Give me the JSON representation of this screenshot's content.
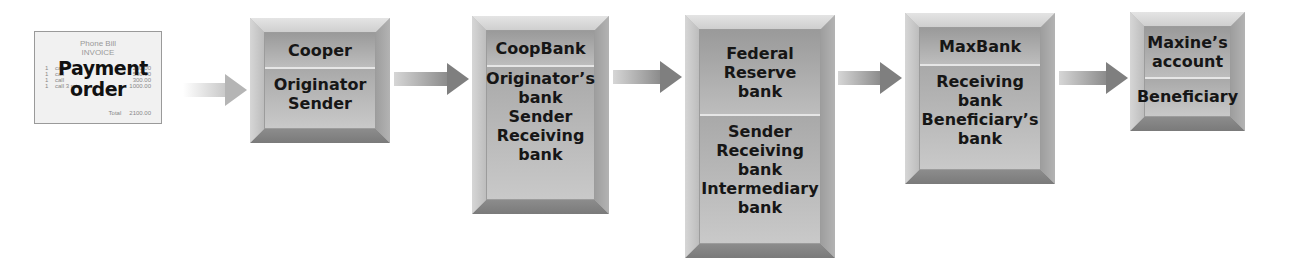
{
  "invoice": {
    "header_line1": "Phone Bill",
    "header_line2": "INVOICE",
    "title": "Payment order",
    "rows": [
      {
        "qty": "1",
        "desc": "call",
        "amount": "200.00"
      },
      {
        "qty": "1",
        "desc": "call",
        "amount": "500.00"
      },
      {
        "qty": "1",
        "desc": "call",
        "amount": "300.00"
      },
      {
        "qty": "1",
        "desc": "call 3 min",
        "amount": "1000.00"
      }
    ],
    "total_label": "Total",
    "total_value": "2100.00"
  },
  "nodes": [
    {
      "id": "cooper",
      "top": "Cooper",
      "bottom": "Originator\nSender"
    },
    {
      "id": "coopbank",
      "top": "CoopBank",
      "bottom": "Originator’s\nbank\nSender\nReceiving\nbank"
    },
    {
      "id": "federal-reserve",
      "top": "Federal\nReserve\nbank",
      "bottom": "Sender\nReceiving\nbank\nIntermediary\nbank"
    },
    {
      "id": "maxbank",
      "top": "MaxBank",
      "bottom": "Receiving\nbank\nBeneficiary’s\nbank"
    },
    {
      "id": "maxines-account",
      "top": "Maxine’s\naccount",
      "bottom": "Beneficiary"
    }
  ],
  "colors": {
    "box_gray": "#b8b8b8",
    "arrow_gray": "#7f7f7f",
    "text": "#161616"
  }
}
